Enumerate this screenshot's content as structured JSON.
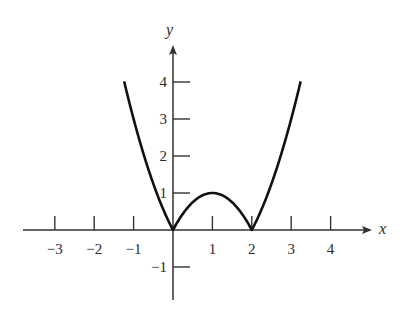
{
  "chart_data": {
    "type": "line",
    "title": "",
    "function": "y = |x^2 - 2x|",
    "xlabel": "x",
    "ylabel": "y",
    "xlim": [
      -3.7,
      4.9
    ],
    "ylim": [
      -1.8,
      5.3
    ],
    "grid": false,
    "legend": null,
    "x_ticks": [
      -3,
      -2,
      -1,
      1,
      2,
      3,
      4
    ],
    "x_tick_labels": [
      "−3",
      "−2",
      "−1",
      "1",
      "2",
      "3",
      "4"
    ],
    "y_ticks": [
      4,
      3,
      2,
      1,
      -1
    ],
    "y_tick_labels": [
      "4",
      "3",
      "2",
      "1",
      "−1"
    ],
    "series": [
      {
        "name": "y = |x^2 - 2x|",
        "x": [
          -1.24,
          -1.0,
          -0.75,
          -0.5,
          -0.25,
          0,
          0.25,
          0.5,
          0.75,
          1.0,
          1.25,
          1.5,
          1.75,
          2.0,
          2.25,
          2.5,
          2.75,
          3.0,
          3.24
        ],
        "y": [
          4.02,
          3.0,
          2.06,
          1.25,
          0.56,
          0,
          0.44,
          0.75,
          0.94,
          1.0,
          0.94,
          0.75,
          0.44,
          0,
          0.56,
          1.25,
          2.06,
          3.0,
          4.02
        ]
      }
    ],
    "key_points": [
      {
        "x": 0,
        "y": 0,
        "note": "cusp"
      },
      {
        "x": 1,
        "y": 1,
        "note": "local max"
      },
      {
        "x": 2,
        "y": 0,
        "note": "cusp"
      }
    ],
    "colors": {
      "curve": "#111111",
      "axes": "#333333",
      "text": "#2a2a2a"
    }
  },
  "axes": {
    "x_name": "x",
    "y_name": "y"
  }
}
